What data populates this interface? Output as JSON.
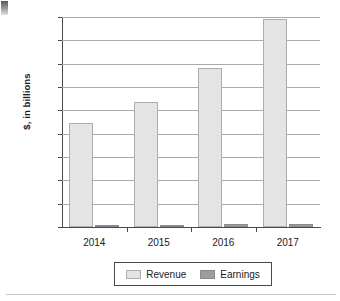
{
  "chart_data": {
    "type": "bar",
    "title": "",
    "xlabel": "",
    "ylabel": "$, in billions",
    "categories": [
      "2014",
      "2015",
      "2016",
      "2017"
    ],
    "series": [
      {
        "name": "Revenue",
        "color": "#e4e4e4",
        "values": [
          89,
          107,
          136,
          178
        ]
      },
      {
        "name": "Earnings",
        "color": "#9d9d9d",
        "values": [
          0.3,
          0.6,
          2.4,
          3.0
        ]
      }
    ],
    "ylim": [
      0,
      180
    ],
    "yticks": [
      0,
      20,
      40,
      60,
      80,
      100,
      120,
      140,
      160,
      180
    ],
    "ytick_labels": [
      "0",
      "20",
      "40",
      "60",
      "80",
      "100",
      "120",
      "140",
      "160",
      "180"
    ],
    "grid": true,
    "legend_position": "bottom"
  },
  "legend": {
    "entries": [
      {
        "label": "Revenue"
      },
      {
        "label": "Earnings"
      }
    ]
  }
}
